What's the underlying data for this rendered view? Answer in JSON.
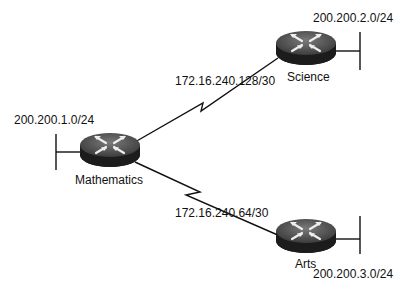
{
  "diagram": {
    "type": "network-topology",
    "routers": [
      {
        "id": "mathematics",
        "label": "Mathematics",
        "lan": "200.200.1.0/24"
      },
      {
        "id": "science",
        "label": "Science",
        "lan": "200.200.2.0/24"
      },
      {
        "id": "arts",
        "label": "Arts",
        "lan": "200.200.3.0/24"
      }
    ],
    "links": [
      {
        "from": "mathematics",
        "to": "science",
        "subnet": "172.16.240.128/30",
        "type": "serial"
      },
      {
        "from": "mathematics",
        "to": "arts",
        "subnet": "172.16.240.64/30",
        "type": "serial"
      }
    ],
    "colors": {
      "router_top": "#5a5a5a",
      "router_body": "#1e1e1e",
      "arrow": "#e8e8e8",
      "line": "#111111"
    }
  }
}
